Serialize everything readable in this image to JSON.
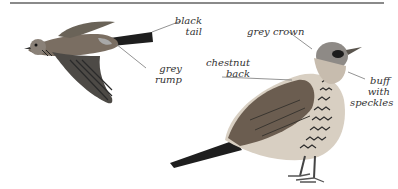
{
  "illustration": {
    "subject": "Fieldfare thrush",
    "flying_bird_labels": {
      "tail": [
        "black",
        "tail"
      ],
      "rump": [
        "grey",
        "rump"
      ]
    },
    "perched_bird_labels": {
      "crown": "grey crown",
      "back": [
        "chestnut",
        "back"
      ],
      "breast": [
        "buff",
        "with",
        "speckles"
      ]
    }
  },
  "colors": {
    "rule": "#8a8a8a",
    "label_text": "#333333",
    "leader_line": "#777777"
  }
}
